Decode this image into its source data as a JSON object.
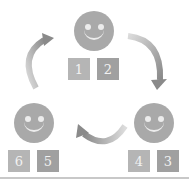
{
  "diagram": {
    "type": "cycle",
    "nodes": [
      {
        "id": "top",
        "icon": "smiley-face-icon",
        "cards": [
          "1",
          "2"
        ]
      },
      {
        "id": "right",
        "icon": "smiley-face-icon",
        "cards": [
          "4",
          "3"
        ]
      },
      {
        "id": "left",
        "icon": "smiley-face-icon",
        "cards": [
          "6",
          "5"
        ]
      }
    ],
    "arrows": [
      {
        "from": "top",
        "to": "right",
        "direction": "clockwise"
      },
      {
        "from": "right",
        "to": "left",
        "direction": "clockwise"
      },
      {
        "from": "left",
        "to": "top",
        "direction": "clockwise"
      }
    ],
    "colors": {
      "face": "#a9a9a9",
      "card_light": "#b5b5b5",
      "card_dark": "#a0a0a0",
      "arrow_dark": "#8c8c8c",
      "arrow_light": "#d8d8d8"
    }
  }
}
